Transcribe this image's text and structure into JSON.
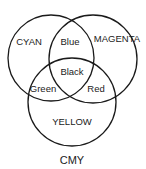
{
  "diagram": {
    "title": "CMY",
    "type": "venn",
    "circles": [
      {
        "id": "cyan",
        "label": "CYAN"
      },
      {
        "id": "magenta",
        "label": "MAGENTA"
      },
      {
        "id": "yellow",
        "label": "YELLOW"
      }
    ],
    "intersections": {
      "cyan_magenta": "Blue",
      "cyan_yellow": "Green",
      "magenta_yellow": "Red",
      "all": "Black"
    },
    "stroke_color": "#1a1a1a"
  }
}
